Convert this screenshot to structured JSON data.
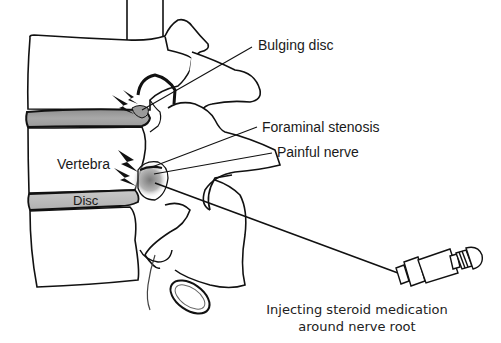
{
  "diagram": {
    "labels": {
      "bulging_disc": "Bulging disc",
      "foraminal_stenosis": "Foraminal stenosis",
      "painful_nerve": "Painful nerve",
      "vertebra": "Vertebra",
      "disc": "Disc"
    },
    "caption": {
      "line1": "Injecting steroid medication",
      "line2": "around nerve root"
    },
    "colors": {
      "outline": "#111111",
      "disc_fill": "#a9a9a9",
      "bone_fill": "#ffffff",
      "inflamed_center": "#8c8c8c",
      "background": "#ffffff"
    }
  }
}
